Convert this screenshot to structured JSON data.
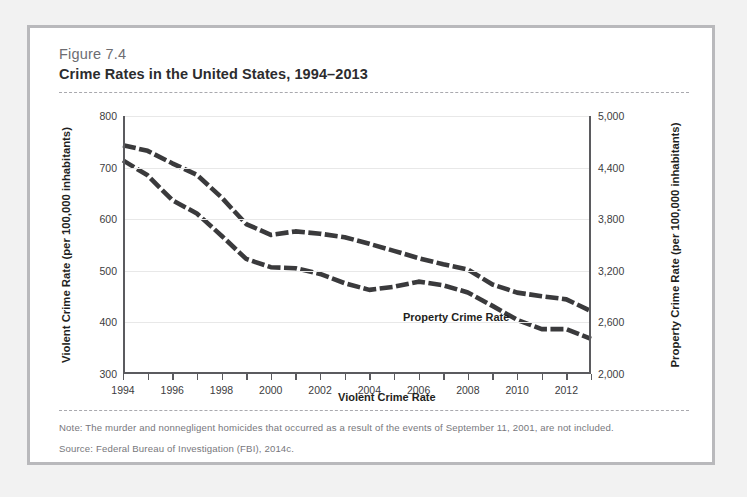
{
  "figure": {
    "number": "Figure 7.4",
    "title": "Crime Rates in the United States, 1994–2013",
    "note": "Note: The murder and nonnegligent homicides that occurred as a result of the events of September 11, 2001, are not included.",
    "source": "Source: Federal Bureau of Investigation (FBI), 2014c."
  },
  "chart_data": {
    "type": "line",
    "title": "Crime Rates in the United States, 1994–2013",
    "xlabel": "",
    "x": [
      1994,
      1995,
      1996,
      1997,
      1998,
      1999,
      2000,
      2001,
      2002,
      2003,
      2004,
      2005,
      2006,
      2007,
      2008,
      2009,
      2010,
      2011,
      2012,
      2013
    ],
    "xtick_labels": [
      "1994",
      "",
      "1996",
      "",
      "1998",
      "",
      "2000",
      "",
      "2002",
      "",
      "2004",
      "",
      "2006",
      "",
      "2008",
      "",
      "2010",
      "",
      "2012",
      ""
    ],
    "xlim": [
      1994,
      2013
    ],
    "grid": true,
    "legend_position": "inline-annotations",
    "axes": [
      {
        "id": "left",
        "ylabel": "Violent Crime Rate (per 100,000 inhabitants)",
        "ylim": [
          300,
          800
        ],
        "yticks": [
          300,
          400,
          500,
          600,
          700,
          800
        ],
        "ytick_labels": [
          "300",
          "400",
          "500",
          "600",
          "700",
          "800"
        ]
      },
      {
        "id": "right",
        "ylabel": "Property Crime Rate (per 100,000 inhabitants)",
        "ylim": [
          2000,
          5000
        ],
        "yticks": [
          2000,
          2600,
          3200,
          3800,
          4400,
          5000
        ],
        "ytick_labels": [
          "2,000",
          "2,600",
          "3,200",
          "3,800",
          "4,400",
          "5,000"
        ]
      }
    ],
    "series": [
      {
        "name": "Property Crime Rate",
        "axis": "right",
        "annotation": "Property Crime Rate",
        "color": "#3a3a3c",
        "style": "dashed",
        "values": [
          4660,
          4595,
          4450,
          4316,
          4053,
          3744,
          3618,
          3658,
          3631,
          3591,
          3514,
          3432,
          3347,
          3276,
          3215,
          3041,
          2946,
          2905,
          2868,
          2731
        ]
      },
      {
        "name": "Violent Crime Rate",
        "axis": "left",
        "annotation": "Violent Crime Rate",
        "color": "#3a3a3c",
        "style": "dashed",
        "values": [
          714,
          685,
          637,
          611,
          568,
          523,
          507,
          505,
          494,
          476,
          463,
          469,
          479,
          472,
          458,
          432,
          405,
          387,
          387,
          368
        ]
      }
    ]
  }
}
